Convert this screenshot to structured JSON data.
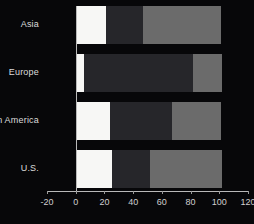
{
  "chart_data": {
    "type": "bar",
    "orientation": "horizontal",
    "stacked": true,
    "title": "",
    "subtitle": "",
    "xlabel": "",
    "ylabel": "",
    "xlim": [
      -20,
      120
    ],
    "xticks": [
      -20,
      0,
      20,
      40,
      60,
      80,
      100,
      120
    ],
    "xtick_labels": [
      "-20",
      "0",
      "20",
      "40",
      "60",
      "80",
      "100",
      "120"
    ],
    "grid": false,
    "legend": "none",
    "categories": [
      "Asia",
      "Europe",
      "Latin America",
      "U.S."
    ],
    "series": [
      {
        "name": "segment-1",
        "color": "#f7f7f5",
        "values": [
          21,
          6,
          24,
          25
        ]
      },
      {
        "name": "segment-2",
        "color": "#26262a",
        "values": [
          26,
          76,
          43,
          27
        ]
      },
      {
        "name": "segment-3",
        "color": "#6b6b6b",
        "values": [
          54,
          20,
          34,
          50
        ]
      }
    ],
    "totals": [
      101,
      102,
      101,
      102
    ],
    "background_color": "#070709",
    "axis_color": "#b9b9b9",
    "text_color": "#dcdcdc"
  }
}
